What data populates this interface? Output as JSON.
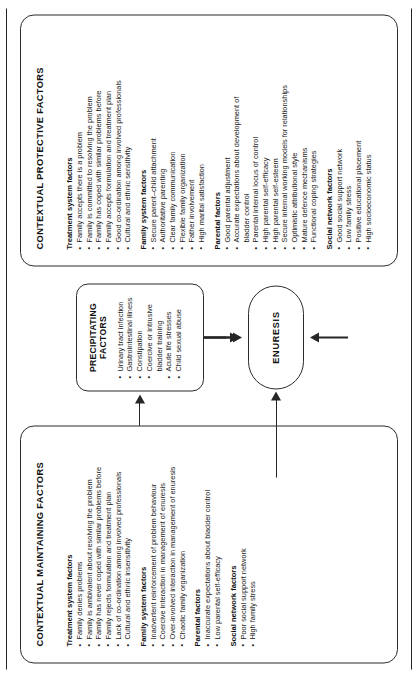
{
  "figure": {
    "type": "flow-diagram",
    "subject": "ENURESIS"
  },
  "maintaining_panel": {
    "title": "CONTEXTUAL MAINTAINING FACTORS",
    "groups": [
      {
        "heading": "Treatment system factors",
        "items": [
          "Family denies problems",
          "Family is ambivalent about resolving the problem",
          "Family has never coped with similar problems before",
          "Family rejects formulation and treatment plan",
          "Lack of co-ordination among involved professionals",
          "Cultural and ethnic insensitivity"
        ]
      },
      {
        "heading": "Family system factors",
        "items": [
          "Inadvertent reinforcement of problem behaviour",
          "Coercive interaction in management of enuresis",
          "Over-involved interaction in management of enuresis",
          "Chaotic family organization"
        ]
      },
      {
        "heading": "Parental factors",
        "items": [
          "Inaccurate expectations about bladder control",
          "Low parental self-efficacy"
        ]
      },
      {
        "heading": "Social network factors",
        "items": [
          "Poor social support network",
          "High family stress"
        ]
      }
    ]
  },
  "precipitating_panel": {
    "title_line1": "PRECIPITATING",
    "title_line2": "FACTORS",
    "items": [
      "Urinary tract infection",
      "Gastrointestinal illness",
      "Constipation",
      "Coercive or intrusive",
      "bladder training",
      "Acute life stresses",
      "Child sexual abuse"
    ],
    "continuation_indices": [
      4
    ]
  },
  "protective_panel": {
    "title": "CONTEXTUAL PROTECTIVE FACTORS",
    "groups": [
      {
        "heading": "Treatment system factors",
        "items": [
          "Family accepts there is a problem",
          "Family is committed to resolving the problem",
          "Family has coped with similar problems before",
          "Family accepts formulation and treatment plan",
          "Good co-ordination among involved professionals",
          "Cultural and ethnic sensitivity"
        ]
      },
      {
        "heading": "Family system factors",
        "items": [
          "Secure parent–child attachment",
          "Authoritative parenting",
          "Clear family communication",
          "Flexible family organization",
          "Father involvement",
          "High marital satisfaction"
        ]
      },
      {
        "heading": "Parental factors",
        "items": [
          "Good parental adjustment",
          "Accurate expectations about development of",
          "bladder control",
          "Parental internal locus of control",
          "High parental self-efficacy",
          "High parental self-esteem",
          "Secure internal working models for relationships",
          "Optimistic attributional style",
          "Mature defence mechanisms",
          "Functional coping strategies"
        ],
        "continuation_indices": [
          2
        ]
      },
      {
        "heading": "Social network factors",
        "items": [
          "Good social support network",
          "Low family stress",
          "Positive educational placement",
          "High socioeconomic status"
        ]
      }
    ]
  },
  "node": {
    "label": "ENURESIS"
  }
}
